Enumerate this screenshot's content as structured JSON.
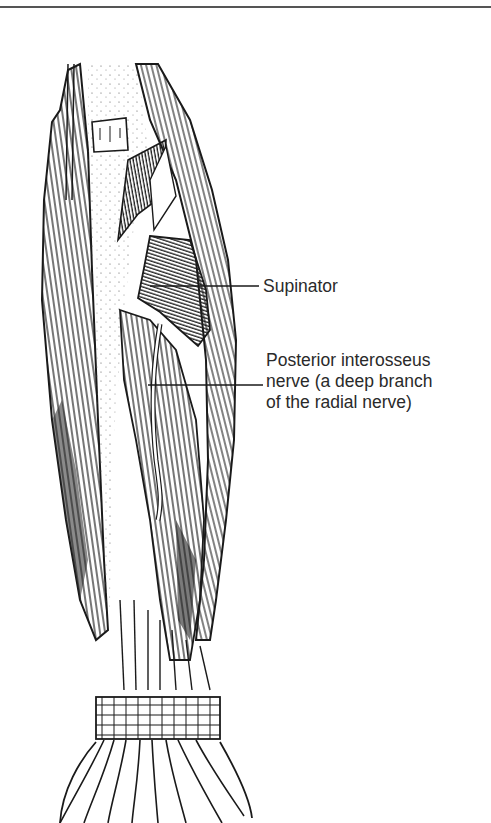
{
  "figure": {
    "labels": [
      {
        "id": "supinator",
        "text": "Supinator"
      },
      {
        "id": "posterior-interosseus-nerve",
        "lines": [
          "Posterior interosseus",
          "nerve (a deep branch",
          "of the radial nerve)"
        ]
      }
    ],
    "colors": {
      "ink": "#1a1a1a",
      "label_text": "#2a2a2a",
      "rule": "#555555",
      "background": "#ffffff"
    }
  }
}
